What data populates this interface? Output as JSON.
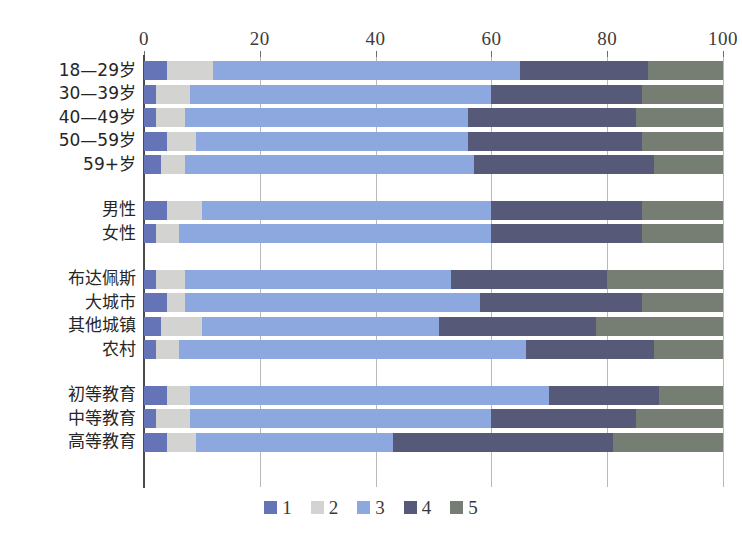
{
  "chart_data": {
    "type": "bar",
    "orientation": "horizontal",
    "stacked": true,
    "normalized": true,
    "title": "",
    "subtitle": "",
    "xlabel": "",
    "ylabel": "",
    "xlim": [
      0,
      100
    ],
    "xticks": [
      0,
      20,
      40,
      60,
      80,
      100
    ],
    "xtick_labels": [
      "0",
      "20",
      "40",
      "60",
      "80",
      "100"
    ],
    "grid": true,
    "grid_axis": "x",
    "legend_position": "bottom",
    "legend_entries": [
      "1",
      "2",
      "3",
      "4",
      "5"
    ],
    "series": [
      {
        "name": "1",
        "color": "#6573b7",
        "values": [
          4,
          2,
          2,
          4,
          3,
          4,
          2,
          2,
          4,
          3,
          2,
          4,
          2,
          4
        ]
      },
      {
        "name": "2",
        "color": "#d3d3d1",
        "values": [
          8,
          6,
          5,
          5,
          4,
          6,
          4,
          5,
          3,
          7,
          4,
          4,
          6,
          5
        ]
      },
      {
        "name": "3",
        "color": "#8ca8de",
        "values": [
          53,
          52,
          49,
          47,
          50,
          50,
          54,
          46,
          51,
          41,
          60,
          62,
          52,
          34
        ]
      },
      {
        "name": "4",
        "color": "#565a78",
        "values": [
          22,
          26,
          29,
          30,
          31,
          26,
          26,
          27,
          28,
          27,
          22,
          19,
          25,
          38
        ]
      },
      {
        "name": "5",
        "color": "#767d72",
        "values": [
          13,
          14,
          15,
          14,
          12,
          14,
          14,
          20,
          14,
          22,
          12,
          11,
          15,
          19
        ]
      }
    ],
    "categories": [
      "18—29岁",
      "30—39岁",
      "40—49岁",
      "50—59岁",
      "59+岁",
      "男性",
      "女性",
      "布达佩斯",
      "大城市",
      "其他城镇",
      "农村",
      "初等教育",
      "中等教育",
      "高等教育"
    ],
    "category_groups": [
      {
        "name": "age",
        "categories": [
          "18—29岁",
          "30—39岁",
          "40—49岁",
          "50—59岁",
          "59+岁"
        ]
      },
      {
        "name": "gender",
        "categories": [
          "男性",
          "女性"
        ]
      },
      {
        "name": "settlement",
        "categories": [
          "布达佩斯",
          "大城市",
          "其他城镇",
          "农村"
        ]
      },
      {
        "name": "education",
        "categories": [
          "初等教育",
          "中等教育",
          "高等教育"
        ]
      }
    ],
    "rows": [
      {
        "label": "18—29岁",
        "group": "age",
        "values": [
          4,
          8,
          53,
          22,
          13
        ]
      },
      {
        "label": "30—39岁",
        "group": "age",
        "values": [
          2,
          6,
          52,
          26,
          14
        ]
      },
      {
        "label": "40—49岁",
        "group": "age",
        "values": [
          2,
          5,
          49,
          29,
          15
        ]
      },
      {
        "label": "50—59岁",
        "group": "age",
        "values": [
          4,
          5,
          47,
          30,
          14
        ]
      },
      {
        "label": "59+岁",
        "group": "age",
        "values": [
          3,
          4,
          50,
          31,
          12
        ]
      },
      {
        "label": "男性",
        "group": "gender",
        "values": [
          4,
          6,
          50,
          26,
          14
        ]
      },
      {
        "label": "女性",
        "group": "gender",
        "values": [
          2,
          4,
          54,
          26,
          14
        ]
      },
      {
        "label": "布达佩斯",
        "group": "settlement",
        "values": [
          2,
          5,
          46,
          27,
          20
        ]
      },
      {
        "label": "大城市",
        "group": "settlement",
        "values": [
          4,
          3,
          51,
          28,
          14
        ]
      },
      {
        "label": "其他城镇",
        "group": "settlement",
        "values": [
          3,
          7,
          41,
          27,
          22
        ]
      },
      {
        "label": "农村",
        "group": "settlement",
        "values": [
          2,
          4,
          60,
          22,
          12
        ]
      },
      {
        "label": "初等教育",
        "group": "education",
        "values": [
          4,
          4,
          62,
          19,
          11
        ]
      },
      {
        "label": "中等教育",
        "group": "education",
        "values": [
          2,
          6,
          52,
          25,
          15
        ]
      },
      {
        "label": "高等教育",
        "group": "education",
        "values": [
          4,
          5,
          34,
          38,
          19
        ]
      }
    ]
  },
  "legend": {
    "items": [
      {
        "label": "1",
        "color": "#6573b7"
      },
      {
        "label": "2",
        "color": "#d3d3d1"
      },
      {
        "label": "3",
        "color": "#8ca8de"
      },
      {
        "label": "4",
        "color": "#565a78"
      },
      {
        "label": "5",
        "color": "#767d72"
      }
    ]
  },
  "colors": {
    "axis": "#4a4a4a",
    "gridline": "#b9b9b9",
    "background": "#ffffff",
    "text": "#262626"
  }
}
